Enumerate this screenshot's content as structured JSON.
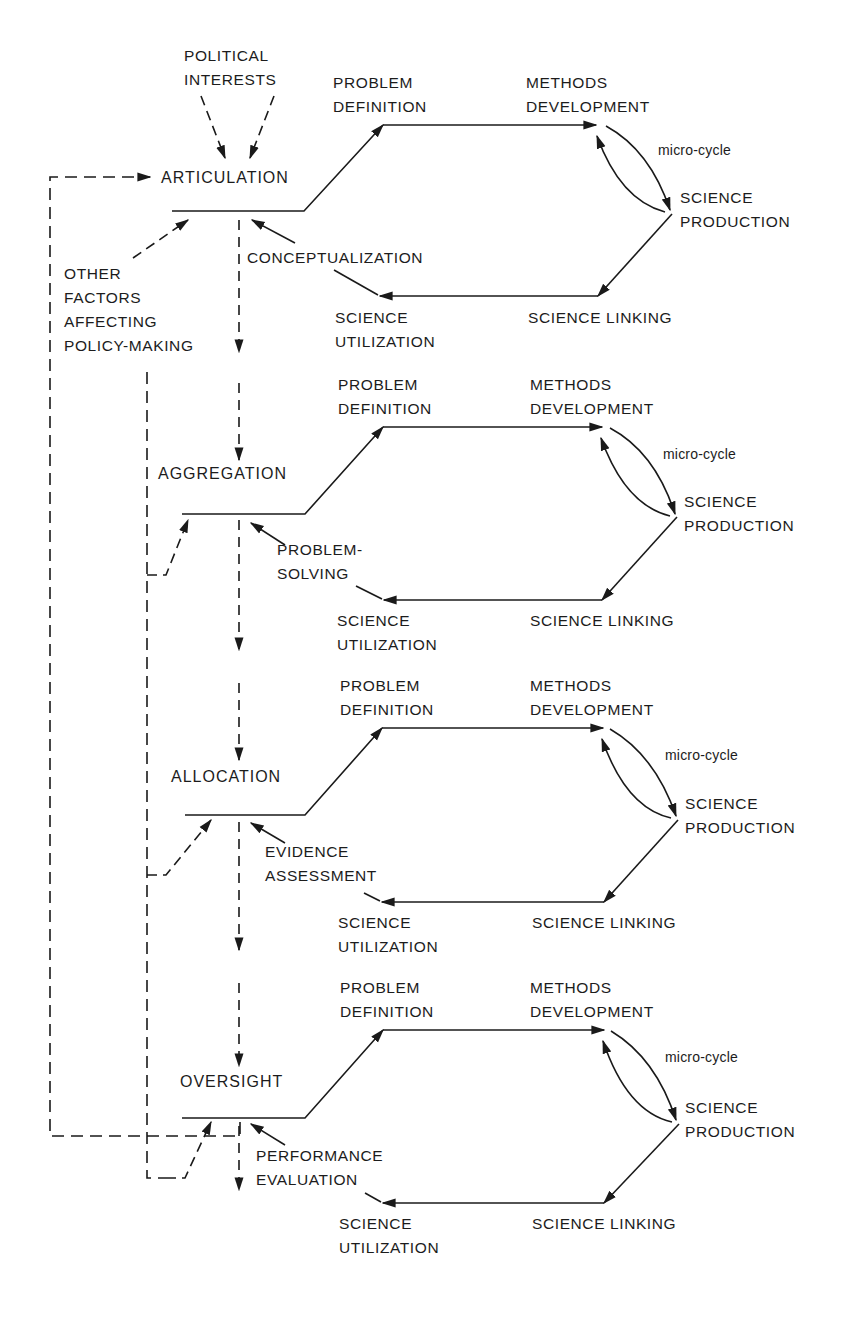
{
  "diagram": {
    "inputs": {
      "political_interests": "POLITICAL\nINTERESTS",
      "other_factors": "OTHER\nFACTORS\nAFFECTING\nPOLICY-MAKING"
    },
    "stages": [
      {
        "name": "ARTICULATION",
        "feedback_label": "CONCEPTUALIZATION",
        "cycle": {
          "problem_definition": "PROBLEM\nDEFINITION",
          "methods_development": "METHODS\nDEVELOPMENT",
          "micro_cycle": "micro-cycle",
          "science_production": "SCIENCE\nPRODUCTION",
          "science_linking": "SCIENCE LINKING",
          "science_utilization": "SCIENCE\nUTILIZATION"
        }
      },
      {
        "name": "AGGREGATION",
        "feedback_label": "PROBLEM-\nSOLVING",
        "cycle": {
          "problem_definition": "PROBLEM\nDEFINITION",
          "methods_development": "METHODS\nDEVELOPMENT",
          "micro_cycle": "micro-cycle",
          "science_production": "SCIENCE\nPRODUCTION",
          "science_linking": "SCIENCE LINKING",
          "science_utilization": "SCIENCE\nUTILIZATION"
        }
      },
      {
        "name": "ALLOCATION",
        "feedback_label": "EVIDENCE\nASSESSMENT",
        "cycle": {
          "problem_definition": "PROBLEM\nDEFINITION",
          "methods_development": "METHODS\nDEVELOPMENT",
          "micro_cycle": "micro-cycle",
          "science_production": "SCIENCE\nPRODUCTION",
          "science_linking": "SCIENCE LINKING",
          "science_utilization": "SCIENCE\nUTILIZATION"
        }
      },
      {
        "name": "OVERSIGHT",
        "feedback_label": "PERFORMANCE\nEVALUATION",
        "cycle": {
          "problem_definition": "PROBLEM\nDEFINITION",
          "methods_development": "METHODS\nDEVELOPMENT",
          "micro_cycle": "micro-cycle",
          "science_production": "SCIENCE\nPRODUCTION",
          "science_linking": "SCIENCE LINKING",
          "science_utilization": "SCIENCE\nUTILIZATION"
        }
      }
    ],
    "colors": {
      "ink": "#1a1a1a",
      "background": "#ffffff"
    }
  }
}
